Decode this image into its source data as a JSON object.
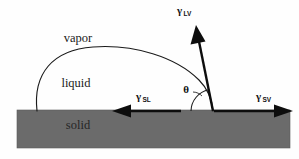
{
  "figure": {
    "background_color": "#fefefe",
    "type": "physics-schematic"
  },
  "phases": {
    "vapor_label": "vapor",
    "liquid_label": "liquid",
    "solid_label": "solid",
    "solid_fill_color": "#6b6b6b",
    "solid_text_color": "#262626",
    "outline_color": "#111111"
  },
  "angle": {
    "symbol": "θ",
    "name": "contact-angle"
  },
  "vectors": [
    {
      "id": "gamma-lv",
      "gamma": "γ",
      "subscript": "LV",
      "description": "liquid-vapor surface tension",
      "direction": "up-left-steep",
      "x1": 213,
      "y1": 111,
      "x2": 196,
      "y2": 27
    },
    {
      "id": "gamma-sl",
      "gamma": "γ",
      "subscript": "SL",
      "description": "solid-liquid interfacial tension",
      "direction": "left",
      "x1": 180,
      "y1": 111,
      "x2": 113,
      "y2": 111
    },
    {
      "id": "gamma-sv",
      "gamma": "γ",
      "subscript": "SV",
      "description": "solid-vapor surface tension",
      "direction": "right",
      "x1": 214,
      "y1": 111,
      "x2": 292,
      "y2": 111
    }
  ],
  "geometry": {
    "solid_block": {
      "x": 17,
      "y": 110,
      "width": 273,
      "height": 38
    },
    "droplet": {
      "left_contact_x": 37,
      "right_contact_x": 213,
      "baseline_y": 111,
      "apex_x": 125,
      "apex_y": 50
    },
    "theta_arc": {
      "center_x": 213,
      "center_y": 111,
      "radius": 22,
      "start_deg": 180,
      "end_deg": 101
    }
  },
  "label_positions": {
    "vapor": {
      "x": 78,
      "y": 42
    },
    "liquid": {
      "x": 76,
      "y": 87
    },
    "solid": {
      "x": 78,
      "y": 129
    },
    "gamma_lv": {
      "x": 177,
      "y": 14
    },
    "gamma_sl": {
      "x": 136,
      "y": 100
    },
    "gamma_sv": {
      "x": 256,
      "y": 100
    },
    "theta": {
      "x": 186,
      "y": 93
    }
  }
}
